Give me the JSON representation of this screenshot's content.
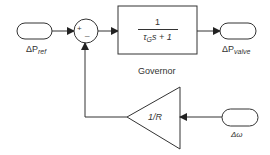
{
  "diagram": {
    "type": "block-diagram",
    "input_ref": {
      "label_main": "ΔP",
      "label_sub": "ref"
    },
    "summing_junction": {
      "plus": "+",
      "minus": "_"
    },
    "governor_block": {
      "numerator": "1",
      "denominator_tau": "τ",
      "denominator_tau_sub": "G",
      "denominator_rest": "s + 1",
      "caption": "Governor"
    },
    "output": {
      "label_main": "ΔP",
      "label_sub": "valve"
    },
    "feedback_gain": {
      "label": "1/R"
    },
    "input_speed": {
      "label": "Δω"
    },
    "colors": {
      "stroke": "#333333",
      "background": "#ffffff"
    }
  }
}
